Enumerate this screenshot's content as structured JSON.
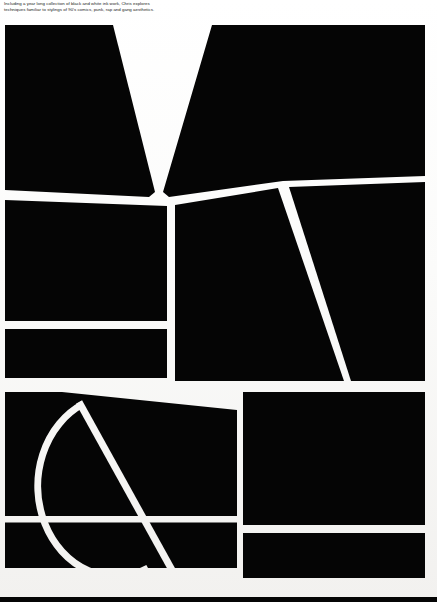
{
  "document": {
    "type": "printed-poster-scan",
    "title": "Black and white ink work exhibition poster",
    "page_background": "#f7f6f4",
    "ink_color": "#050505",
    "paper_color": "#ffffff"
  },
  "caption": {
    "name": "exhibition-blurb",
    "line1": "Including a year long collection of black and white ink work, Chris explores",
    "line2": "techniques familiar to stylings of 90's comics, punk, rap and gang aesthetics.",
    "text": "Including a year long collection of black and white ink work, Chris explores\ntechniques familiar to stylings of 90's comics, punk, rap and gang aesthetics."
  },
  "artwork": {
    "name": "abstract-geometric-composition",
    "description": "Large black abstract shapes separated by white gutters, with a V-shaped wedge at top, a long diagonal at right, and a circular arc with a diagonal chord at lower left.",
    "viewbox": "0 0 437 602",
    "shapes": [
      {
        "name": "top-left-panel",
        "kind": "polygon",
        "fill": "#050505",
        "path": "M5,25 L113,25 L155,192 L148,196 L5,189 Z"
      },
      {
        "name": "top-v-right-panel",
        "kind": "polygon",
        "fill": "#050505",
        "path": "M212,25 L425,25 L425,175 L282,180 L168,196 L162,192 Z"
      },
      {
        "name": "mid-left-upper-panel",
        "kind": "polygon",
        "fill": "#050505",
        "path": "M5,199 L167,205 L167,321 L5,321 Z"
      },
      {
        "name": "mid-left-lower-panel",
        "kind": "polygon",
        "fill": "#050505",
        "path": "M5,328 L167,328 L167,377 L5,377 Z"
      },
      {
        "name": "mid-center-panel",
        "kind": "polygon",
        "fill": "#050505",
        "path": "M175,204 L279,187 L345,381 L175,381 Z"
      },
      {
        "name": "mid-right-panel",
        "kind": "polygon",
        "fill": "#050505",
        "path": "M288,186 L425,181 L425,381 L352,381 Z"
      },
      {
        "name": "bottom-left-arc-panel",
        "kind": "path-with-arc",
        "fill": "#050505",
        "path": "M5,392 L60,392 L240,410 L240,568 L100,568 L5,568 Z"
      },
      {
        "name": "bottom-right-upper-panel",
        "kind": "rect",
        "fill": "#050505",
        "path": "M242,392 L425,392 L425,525 L242,525 Z"
      },
      {
        "name": "bottom-right-lower-panel",
        "kind": "rect",
        "fill": "#050505",
        "path": "M242,533 L425,533 L425,578 L242,578 Z"
      },
      {
        "name": "bottom-edge-strip",
        "kind": "rect",
        "fill": "#050505",
        "path": "M0,597 L437,597 L437,602 L0,602 Z"
      }
    ],
    "white_gutters": [
      {
        "name": "v-wedge-gutter",
        "kind": "wedge"
      },
      {
        "name": "horizontal-gutter-upper",
        "kind": "band"
      },
      {
        "name": "right-diagonal-gutter",
        "kind": "diagonal"
      },
      {
        "name": "arc-gutter",
        "kind": "arc"
      },
      {
        "name": "chord-gutter",
        "kind": "diagonal"
      }
    ]
  }
}
